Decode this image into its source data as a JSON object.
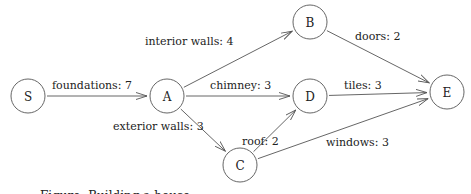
{
  "diagram": {
    "type": "directed-graph",
    "nodes": [
      {
        "id": "S",
        "label": "S"
      },
      {
        "id": "A",
        "label": "A"
      },
      {
        "id": "B",
        "label": "B"
      },
      {
        "id": "D",
        "label": "D"
      },
      {
        "id": "C",
        "label": "C"
      },
      {
        "id": "E",
        "label": "E"
      }
    ],
    "edges": [
      {
        "from": "S",
        "to": "A",
        "label": "foundations: 7"
      },
      {
        "from": "A",
        "to": "B",
        "label": "interior walls: 4"
      },
      {
        "from": "A",
        "to": "D",
        "label": "chimney: 3"
      },
      {
        "from": "A",
        "to": "C",
        "label": "exterior walls: 3"
      },
      {
        "from": "B",
        "to": "E",
        "label": "doors: 2"
      },
      {
        "from": "D",
        "to": "E",
        "label": "tiles: 3"
      },
      {
        "from": "C",
        "to": "D",
        "label": "roof: 2"
      },
      {
        "from": "C",
        "to": "E",
        "label": "windows: 3"
      }
    ]
  },
  "caption": "Figure: Building a house"
}
